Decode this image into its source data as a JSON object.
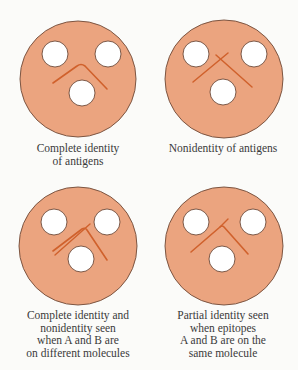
{
  "figure": {
    "colors": {
      "agar": "#eba47f",
      "agar_outline": "#6e4a38",
      "well": "#ffffff",
      "precipitin_line": "#d0612c",
      "caption_text": "#3a3a3a",
      "background": "#fbfbf9"
    },
    "panels": [
      {
        "id": "complete-identity",
        "caption_lines": [
          "Complete identity",
          "of antigens"
        ],
        "pattern": "single chevron (lines fuse at apex)"
      },
      {
        "id": "nonidentity",
        "caption_lines": [
          "Nonidentity of antigens"
        ],
        "pattern": "two crossing lines"
      },
      {
        "id": "identity-and-nonidentity",
        "caption_lines": [
          "Complete identity and",
          "nonidentity seen",
          "when A and B are",
          "on different molecules"
        ],
        "pattern": "double line with fused chevron and crossing spur"
      },
      {
        "id": "partial-identity",
        "caption_lines": [
          "Partial identity seen",
          "when epitopes",
          "A and B are on the",
          "same molecule"
        ],
        "pattern": "chevron with spur"
      }
    ]
  }
}
